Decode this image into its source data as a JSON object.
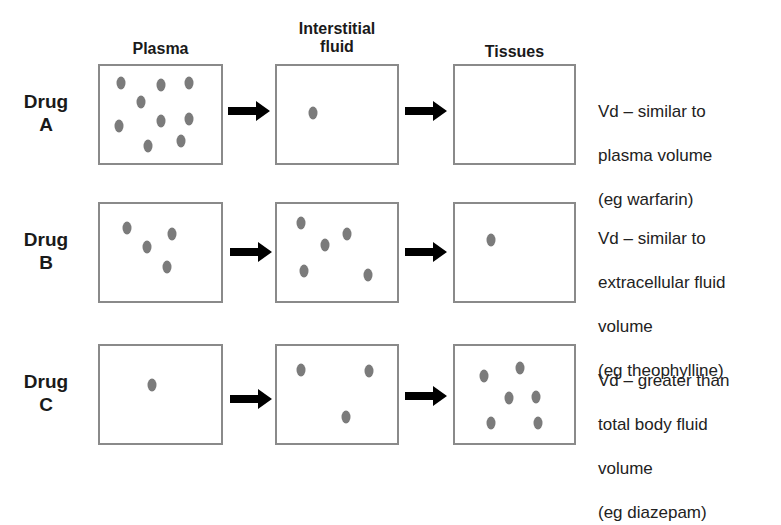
{
  "columns": {
    "plasma": "Plasma",
    "interstitial_line1": "Interstitial",
    "interstitial_line2": "fluid",
    "tissues": "Tissues"
  },
  "rows": [
    {
      "label_line1": "Drug",
      "label_line2": "A",
      "description": [
        "Vd – similar to",
        "plasma volume",
        "(eg warfarin)"
      ],
      "plasma_particles": 9,
      "interstitial_particles": 1,
      "tissue_particles": 0
    },
    {
      "label_line1": "Drug",
      "label_line2": "B",
      "description": [
        "Vd – similar to",
        "extracellular fluid",
        "volume",
        "(eg theophylline)"
      ],
      "plasma_particles": 4,
      "interstitial_particles": 5,
      "tissue_particles": 1
    },
    {
      "label_line1": "Drug",
      "label_line2": "C",
      "description": [
        "Vd – greater than",
        "total body fluid",
        "volume",
        "(eg diazepam)"
      ],
      "plasma_particles": 1,
      "interstitial_particles": 3,
      "tissue_particles": 6
    }
  ],
  "colors": {
    "box_border": "#8a8a8a",
    "particle": "#7b7b7b",
    "arrow": "#000000"
  }
}
